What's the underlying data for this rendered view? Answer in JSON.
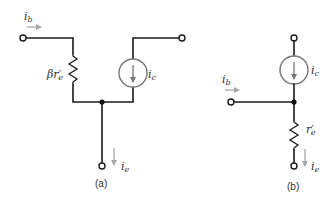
{
  "colors": {
    "wire": "#1a1a1a",
    "current_arrow": "#a8a8a8",
    "source_outline": "#777777",
    "label": "#333333"
  },
  "diagram_a": {
    "caption": "(a)",
    "labels": {
      "base_current": {
        "main": "i",
        "sub": "b"
      },
      "resistor": {
        "prefix": "βr",
        "prime": "′",
        "sub": "e"
      },
      "collector_current": {
        "main": "i",
        "sub": "c"
      },
      "emitter_current": {
        "main": "i",
        "sub": "e"
      }
    },
    "components": [
      "base-terminal",
      "resistor-beta-re",
      "current-source-ic",
      "collector-terminal",
      "junction-node",
      "emitter-terminal"
    ]
  },
  "diagram_b": {
    "caption": "(b)",
    "labels": {
      "base_current": {
        "main": "i",
        "sub": "b"
      },
      "collector_current": {
        "main": "i",
        "sub": "c"
      },
      "resistor": {
        "prefix": "r",
        "prime": "′",
        "sub": "e"
      },
      "emitter_current": {
        "main": "i",
        "sub": "e"
      }
    },
    "components": [
      "collector-terminal",
      "current-source-ic",
      "junction-node",
      "base-terminal",
      "resistor-re",
      "emitter-terminal"
    ]
  }
}
